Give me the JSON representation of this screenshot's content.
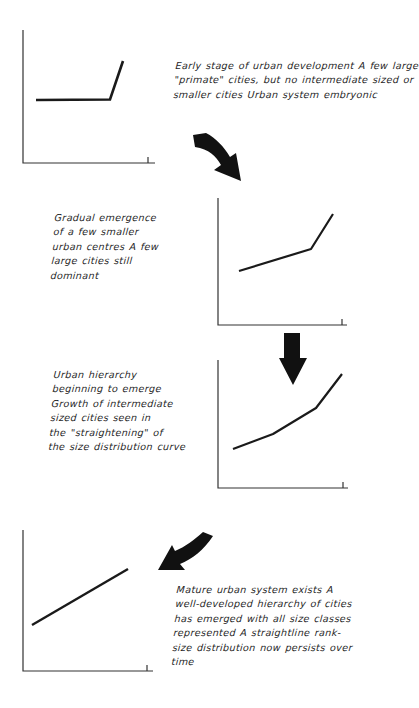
{
  "colors": {
    "ink": "#1a1a1a",
    "background": "#ffffff"
  },
  "stages": [
    {
      "caption_lines": [
        "Early stage of urban development A few large",
        "\"primate\" cities, but no intermediate sized or",
        "smaller cities  Urban system embryonic"
      ],
      "curve_shape": "flat then sharp rise"
    },
    {
      "caption_lines": [
        "Gradual emergence",
        "of a few smaller",
        "urban centres A few",
        "large cities still",
        "dominant"
      ],
      "curve_shape": "gentle slope then steep rise"
    },
    {
      "caption_lines": [
        "Urban hierarchy",
        "beginning to emerge",
        "Growth of intermediate",
        "sized cities seen in",
        "the \"straightening\" of",
        "the size distribution curve"
      ],
      "curve_shape": "convex curve straightening"
    },
    {
      "caption_lines": [
        "Mature urban system exists A",
        "well-developed hierarchy of cities",
        "has emerged with all size classes",
        "represented A straightline rank-",
        "size distribution now persists over",
        "time"
      ],
      "curve_shape": "straight line"
    }
  ],
  "arrows": [
    {
      "icon": "curved-arrow-down-right-icon",
      "from_stage": 1,
      "to_stage": 2
    },
    {
      "icon": "arrow-down-icon",
      "from_stage": 2,
      "to_stage": 3
    },
    {
      "icon": "curved-arrow-down-left-icon",
      "from_stage": 3,
      "to_stage": 4
    }
  ]
}
